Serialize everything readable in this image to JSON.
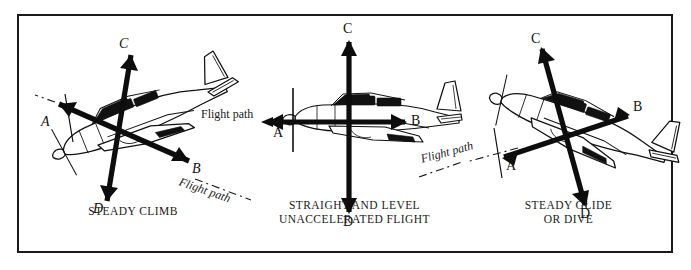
{
  "figure": {
    "border_color": "#1a1a1a",
    "background": "#ffffff",
    "ink_color": "#111111"
  },
  "panels": [
    {
      "id": "steady-climb",
      "caption_lines": [
        "STEADY CLIMB"
      ],
      "attitude_deg": -22,
      "flight_path_labels": [
        "Flight path"
      ],
      "vectors": [
        {
          "label": "A",
          "direction": "forward-up-left",
          "meaning": "drag"
        },
        {
          "label": "B",
          "direction": "aft-down-right",
          "meaning": "thrust"
        },
        {
          "label": "C",
          "direction": "up",
          "meaning": "lift"
        },
        {
          "label": "D",
          "direction": "down",
          "meaning": "weight"
        }
      ]
    },
    {
      "id": "straight-and-level",
      "caption_lines": [
        "STRAIGHT AND LEVEL",
        "UNACCELERATED FLIGHT"
      ],
      "attitude_deg": 0,
      "flight_path_labels": [
        "Flight path"
      ],
      "vectors": [
        {
          "label": "A",
          "direction": "left",
          "meaning": "drag"
        },
        {
          "label": "B",
          "direction": "right",
          "meaning": "thrust"
        },
        {
          "label": "C",
          "direction": "up",
          "meaning": "lift"
        },
        {
          "label": "D",
          "direction": "down",
          "meaning": "weight"
        }
      ]
    },
    {
      "id": "steady-glide-or-dive",
      "caption_lines": [
        "STEADY GLIDE",
        "OR DIVE"
      ],
      "attitude_deg": 19,
      "flight_path_labels": [
        "Flight path"
      ],
      "vectors": [
        {
          "label": "A",
          "direction": "forward-down-left",
          "meaning": "drag"
        },
        {
          "label": "B",
          "direction": "aft-up-right",
          "meaning": "thrust"
        },
        {
          "label": "C",
          "direction": "up",
          "meaning": "lift"
        },
        {
          "label": "D",
          "direction": "down",
          "meaning": "weight"
        }
      ]
    }
  ],
  "labels": {
    "A": "A",
    "B": "B",
    "C": "C",
    "D": "D",
    "flight_path": "Flight path"
  }
}
